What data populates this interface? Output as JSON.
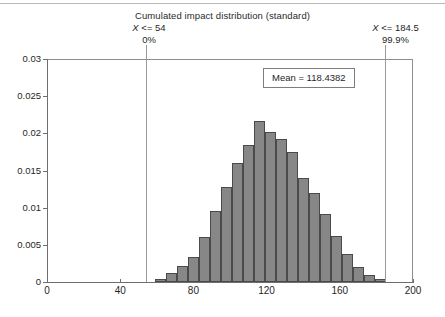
{
  "chart_data": {
    "type": "bar",
    "title": "Cumulated impact distribution (standard)",
    "xlabel": "",
    "ylabel": "",
    "xlim": [
      0,
      200
    ],
    "ylim": [
      0,
      0.03
    ],
    "x_ticks": [
      "0",
      "40",
      "80",
      "120",
      "160",
      "200"
    ],
    "x_tick_values": [
      0,
      40,
      80,
      120,
      160,
      200
    ],
    "y_ticks": [
      "0",
      "0.005",
      "0.01",
      "0.015",
      "0.02",
      "0.025",
      "0.03"
    ],
    "y_tick_values": [
      0,
      0.005,
      0.01,
      0.015,
      0.02,
      0.025,
      0.03
    ],
    "grid": false,
    "legend": "none",
    "bin_width": 6,
    "bar_color": "#878787",
    "bar_edge_color": "#4a4a4a",
    "categories": [
      62,
      68,
      74,
      80,
      86,
      92,
      98,
      104,
      110,
      116,
      122,
      128,
      134,
      140,
      146,
      152,
      158,
      164,
      170,
      176,
      182
    ],
    "values": [
      0.0004,
      0.0012,
      0.0022,
      0.0033,
      0.006,
      0.0095,
      0.0128,
      0.016,
      0.0184,
      0.0217,
      0.0202,
      0.0193,
      0.0175,
      0.014,
      0.012,
      0.0092,
      0.0062,
      0.0038,
      0.002,
      0.001,
      0.0004
    ],
    "annotations": [
      {
        "name": "lower-threshold",
        "label_1": "X <= 54",
        "label_2": "0%",
        "x": 54,
        "percent": "0%"
      },
      {
        "name": "upper-threshold",
        "label_1": "X <= 184.5",
        "label_2": "99.9%",
        "x": 184.5,
        "percent": "99.9%"
      }
    ],
    "mean_label": "Mean = 118.4382",
    "mean_value": 118.4382
  },
  "annotations": {
    "left": {
      "var": "X",
      "op": "<= 54",
      "percent": "0%"
    },
    "right": {
      "var": "X",
      "op": "<= 184.5",
      "percent": "99.9%"
    }
  },
  "mean_box": {
    "text": "Mean = 118.4382"
  }
}
